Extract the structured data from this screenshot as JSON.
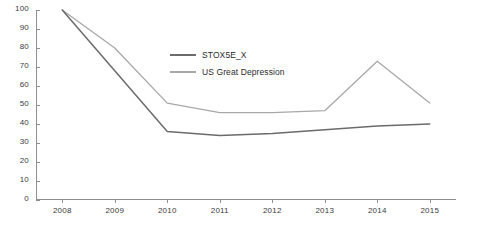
{
  "chart_data": {
    "type": "line",
    "title": "",
    "xlabel": "",
    "ylabel": "",
    "categories": [
      "2008",
      "2009",
      "2010",
      "2011",
      "2012",
      "2013",
      "2014",
      "2015"
    ],
    "ylim": [
      0,
      100
    ],
    "yticks": [
      0,
      10,
      20,
      30,
      40,
      50,
      60,
      70,
      80,
      90,
      100
    ],
    "grid": false,
    "legend_position": "inside-upper-right",
    "series": [
      {
        "name": "STOX5E_X",
        "color": "#6b6b6b",
        "values": [
          100,
          68,
          36,
          34,
          35,
          37,
          39,
          40
        ]
      },
      {
        "name": "US Great Depression",
        "color": "#a8a8a8",
        "values": [
          100,
          80,
          51,
          46,
          46,
          47,
          73,
          51
        ]
      }
    ]
  },
  "axis": {
    "y_tick_labels": [
      "100",
      "90",
      "80",
      "70",
      "60",
      "50",
      "40",
      "30",
      "20",
      "10",
      "0"
    ],
    "x_tick_labels": [
      "2008",
      "2009",
      "2010",
      "2011",
      "2012",
      "2013",
      "2014",
      "2015"
    ]
  },
  "legend": {
    "items": [
      {
        "label": "STOX5E_X",
        "color": "#6b6b6b"
      },
      {
        "label": "US Great Depression",
        "color": "#a8a8a8"
      }
    ]
  }
}
